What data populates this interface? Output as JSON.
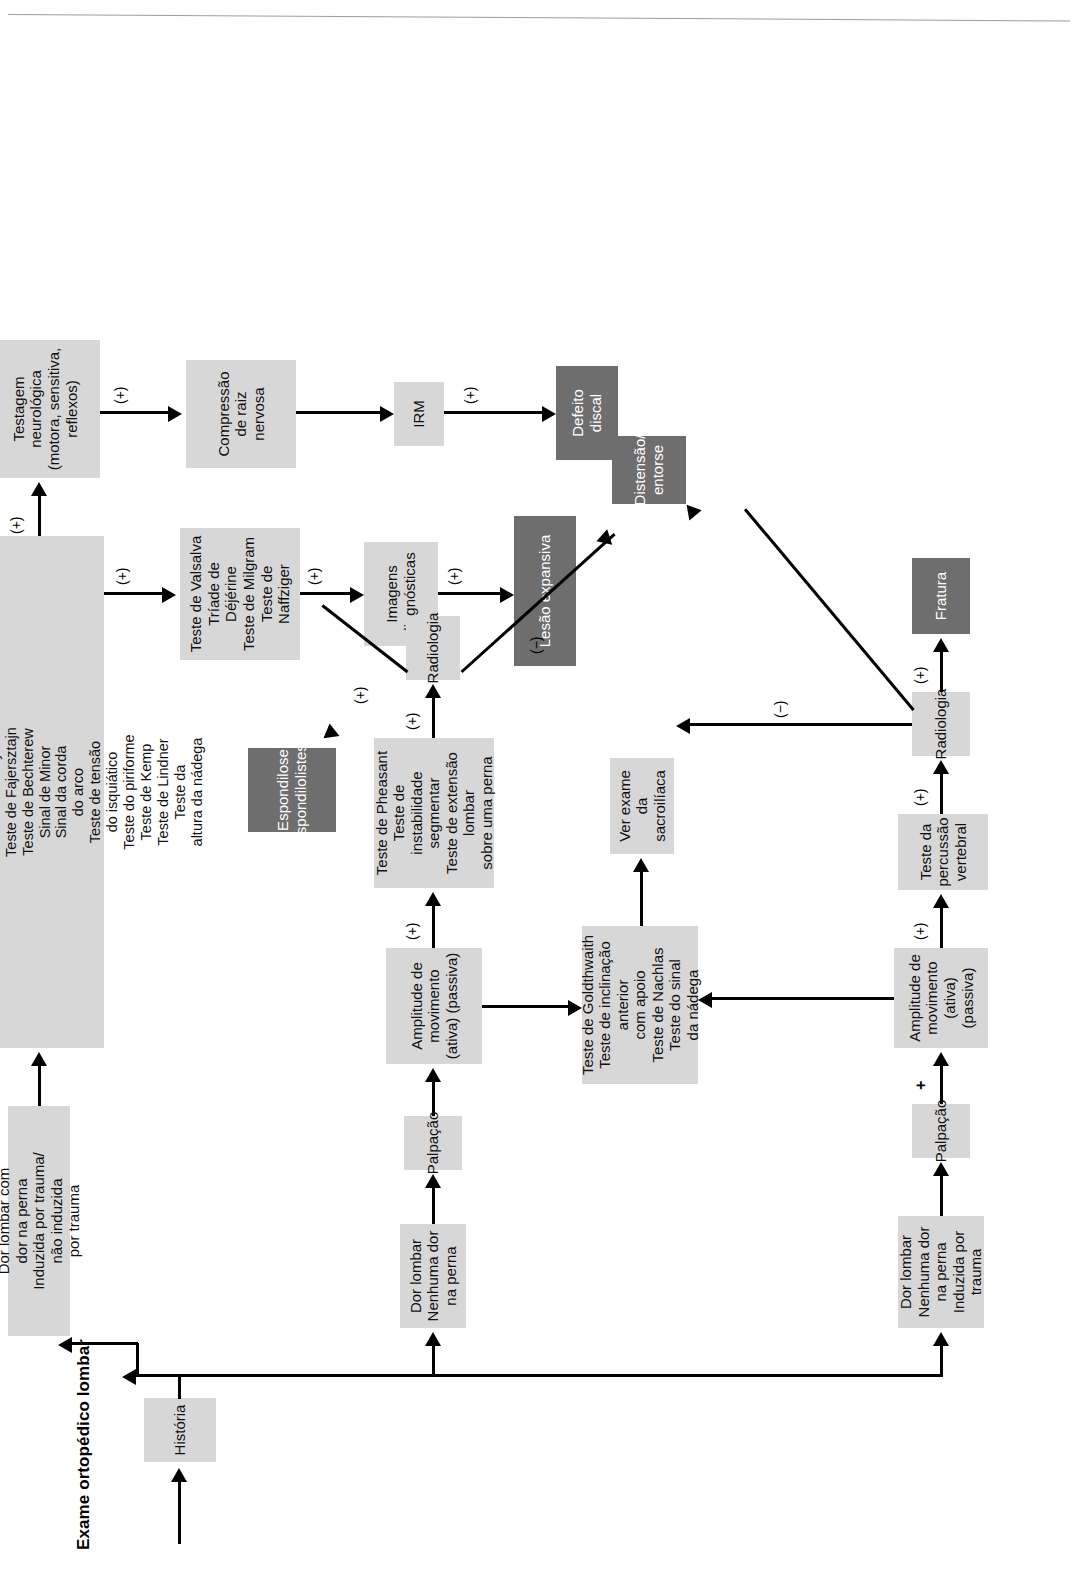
{
  "document": {
    "title": "Exame ortopédico lombar",
    "orientation": "rotated-90-ccw",
    "page_rule": true
  },
  "colors": {
    "box_light": "#d7d7d7",
    "box_light_alt": "#dedede",
    "box_dark": "#6e6e6e",
    "text_dark": "#111111",
    "text_on_dark": "#ffffff",
    "connector": "#000000"
  },
  "nodes": {
    "historia": "História",
    "dor_trauma_leg": "Dor lombar com\ndor na perna\nInduzida por trauma/\nnão induzida\npor trauma",
    "testes_perna": "Teste da elevação da\nperna reta\nTeste de Bragard\nSinal da flexão\ndo joelho\nTeste de Sicard\nTeste de Turyn\nTeste de Fajersztajn\nTeste de Bechterew\nSinal de Minor\nSinal da corda\ndo arco\nTeste de tensão\ndo isquiático\nTeste do piriforme\nTeste de Kemp\nTeste de Lindner\nTeste da\naltura da nádega",
    "testagem_neuro": "Testagem neurológica\n(motora, sensitiva,\nreflexos)",
    "valsalva": "Teste de Valsalva\nTríade de\nDéjérine\nTeste de Milgram\nTeste de\nNaffziger",
    "compressao": "Compressão\nde raiz nervosa",
    "imagens": "Imagens\ndiagnósticas",
    "irm": "IRM",
    "lesao": "Lesão expansiva",
    "defeito": "Defeito discal",
    "dor_sem_perna": "Dor lombar\nNenhuma dor\nna perna",
    "palpacao_mid": "Palpação",
    "amplitude_mid": "Amplitude de movimento\n(ativa) (passiva)",
    "testes_pheasant": "Teste de Pheasant\nTeste de instabilidade\nsegmentar\nTeste de extensão lombar\nsobre uma perna",
    "radiologia_mid": "Radiologia",
    "espondilose": "Espondilose\nEspondilolistese",
    "goldthwaith": "Teste de Goldthwaith\nTeste de inclinação\nanterior\ncom apoio\nTeste de Nachlas\nTeste do sinal\nda nádega",
    "sacroiliaca": "Ver exame da\nsacroilíaca",
    "distensao": "Distensão/\nentorse",
    "dor_trauma_nolg": "Dor lombar\nNenhuma dor\nna perna\nInduzida por trauma",
    "palpacao_bot": "Palpação",
    "amplitude_bot": "Amplitude de\nmovimento\n(ativa) (passiva)",
    "percussao": "Teste da\npercussão\nvertebral",
    "radiologia_bot": "Radiologia",
    "fratura": "Fratura"
  },
  "edge_labels": {
    "plus": "(+)",
    "minus": "(−)",
    "plain_plus": "+"
  },
  "edge_label_list": [
    {
      "id": "testes-to-valsalva",
      "text": "(+)"
    },
    {
      "id": "testes-to-neuro",
      "text": "(+)"
    },
    {
      "id": "neuro-to-compressao",
      "text": "(+)"
    },
    {
      "id": "valsalva-to-imagens",
      "text": "(+)"
    },
    {
      "id": "imagens-to-lesao",
      "text": "(+)"
    },
    {
      "id": "irm-to-defeito",
      "text": "(+)"
    },
    {
      "id": "amplitude-to-pheasant",
      "text": "(+)"
    },
    {
      "id": "pheasant-to-radiologia",
      "text": "(+)"
    },
    {
      "id": "radiologia-to-espondilose",
      "text": "(+)"
    },
    {
      "id": "radiologia-to-distensao",
      "text": "(−)"
    },
    {
      "id": "palpacao-to-amplitude-bot",
      "text": "+"
    },
    {
      "id": "amplitude-to-percussao",
      "text": "(+)"
    },
    {
      "id": "percussao-to-radiologia-bot",
      "text": "(+)"
    },
    {
      "id": "radiologia-bot-to-fratura",
      "text": "(+)"
    },
    {
      "id": "radiologia-bot-to-sacroiliaca",
      "text": "(−)"
    }
  ]
}
